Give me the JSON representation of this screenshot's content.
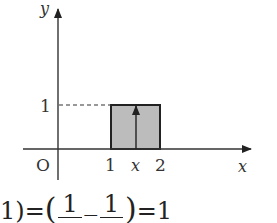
{
  "diagram": {
    "axes": {
      "y_label": "y",
      "x_label": "x",
      "origin_label": "O"
    },
    "ticks": {
      "y_tick_1": "1",
      "x_tick_1": "1",
      "x_tick_x": "x",
      "x_tick_2": "2"
    },
    "rectangle": {
      "x_from": 1,
      "x_to": 2,
      "height": 1,
      "fill": "#bcbcbc",
      "stroke": "#222222"
    },
    "arrow": {
      "at": "x",
      "description": "vertical arrow from x-axis to top of rectangle"
    },
    "dashed_line": {
      "from": "y-axis",
      "to": "rectangle",
      "at_y": 1
    }
  },
  "formula": {
    "prefix": "1)",
    "eq1": "=",
    "open_paren": "(",
    "frac1_num": "1",
    "minus": "—",
    "frac2_num": "1",
    "close_paren": ")",
    "eq2": "=",
    "result": "1"
  }
}
